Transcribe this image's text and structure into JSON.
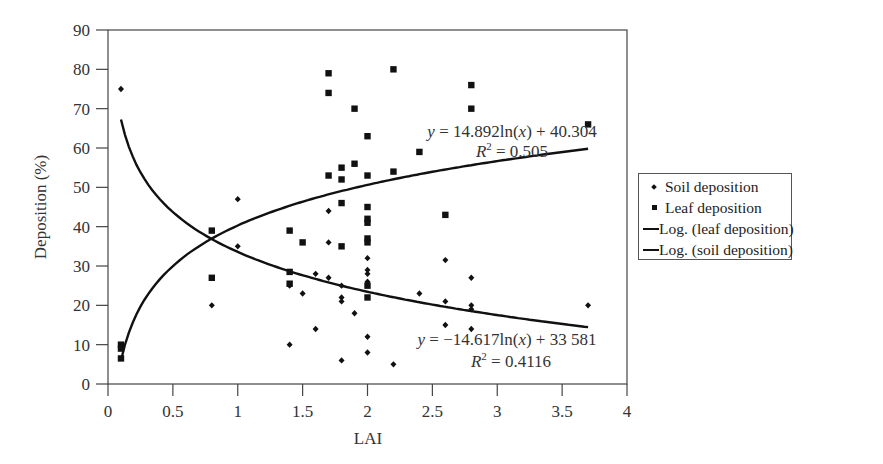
{
  "chart_data": {
    "type": "scatter",
    "title": "",
    "xlabel": "LAI",
    "ylabel": "Deposition (%)",
    "xlim": [
      0,
      4
    ],
    "ylim": [
      0,
      90
    ],
    "x_ticks": [
      "0",
      "0.5",
      "1",
      "1.5",
      "2",
      "2.5",
      "3",
      "3.5",
      "4"
    ],
    "y_ticks": [
      "0",
      "10",
      "20",
      "30",
      "40",
      "50",
      "60",
      "70",
      "80",
      "90"
    ],
    "grid": false,
    "legend_position": "right",
    "series": [
      {
        "name": "Soil deposition",
        "marker": "diamond",
        "points": [
          [
            0.1,
            75
          ],
          [
            0.8,
            20
          ],
          [
            1.0,
            47
          ],
          [
            1.0,
            35
          ],
          [
            1.4,
            25
          ],
          [
            1.4,
            10
          ],
          [
            1.5,
            23
          ],
          [
            1.6,
            28
          ],
          [
            1.6,
            14
          ],
          [
            1.7,
            44
          ],
          [
            1.7,
            36
          ],
          [
            1.7,
            27
          ],
          [
            1.8,
            25
          ],
          [
            1.8,
            22
          ],
          [
            1.8,
            21
          ],
          [
            1.8,
            6
          ],
          [
            1.9,
            18
          ],
          [
            2.0,
            32
          ],
          [
            2.0,
            29
          ],
          [
            2.0,
            28
          ],
          [
            2.0,
            26
          ],
          [
            2.0,
            12
          ],
          [
            2.0,
            8
          ],
          [
            2.2,
            5
          ],
          [
            2.4,
            23
          ],
          [
            2.6,
            31.5
          ],
          [
            2.6,
            21
          ],
          [
            2.6,
            15
          ],
          [
            2.8,
            27
          ],
          [
            2.8,
            20
          ],
          [
            2.8,
            19
          ],
          [
            2.8,
            14
          ],
          [
            3.7,
            20
          ]
        ]
      },
      {
        "name": "Leaf deposition",
        "marker": "square",
        "points": [
          [
            0.1,
            10
          ],
          [
            0.1,
            9
          ],
          [
            0.1,
            6.5
          ],
          [
            0.8,
            39
          ],
          [
            0.8,
            27
          ],
          [
            1.4,
            39
          ],
          [
            1.4,
            28.5
          ],
          [
            1.4,
            25.5
          ],
          [
            1.5,
            36
          ],
          [
            1.7,
            79
          ],
          [
            1.7,
            74
          ],
          [
            1.7,
            53
          ],
          [
            1.8,
            55
          ],
          [
            1.8,
            52
          ],
          [
            1.8,
            46
          ],
          [
            1.8,
            35
          ],
          [
            1.9,
            70
          ],
          [
            1.9,
            56
          ],
          [
            2.0,
            63
          ],
          [
            2.0,
            53
          ],
          [
            2.0,
            45
          ],
          [
            2.0,
            42
          ],
          [
            2.0,
            41
          ],
          [
            2.0,
            37
          ],
          [
            2.0,
            36
          ],
          [
            2.0,
            25
          ],
          [
            2.0,
            22
          ],
          [
            2.2,
            80
          ],
          [
            2.2,
            54
          ],
          [
            2.4,
            59
          ],
          [
            2.6,
            43
          ],
          [
            2.8,
            76
          ],
          [
            2.8,
            70
          ],
          [
            3.7,
            66
          ]
        ]
      },
      {
        "name": "Log. (leaf deposition)",
        "type": "line",
        "equation": "y = 14.892ln(x) + 40.304",
        "a": 14.892,
        "b": 40.304,
        "x_range": [
          0.1,
          3.7
        ],
        "r2": "R2 = 0.505"
      },
      {
        "name": "Log. (soil deposition)",
        "type": "line",
        "equation": "y = −14.617ln(x) + 33 581",
        "a": -14.617,
        "b": 33.581,
        "x_range": [
          0.1,
          3.7
        ],
        "r2": "R2 = 0.4116"
      }
    ],
    "annotations": [
      {
        "text": "y = 14.892ln(x) + 40.304",
        "x": 2.95,
        "y": 63
      },
      {
        "text": "R2 = 0.505",
        "x": 2.95,
        "y": 57
      },
      {
        "text": "y = −14.617ln(x) + 33 581",
        "x": 2.95,
        "y": 10
      },
      {
        "text": "R2 = 0.4116",
        "x": 2.95,
        "y": 4
      }
    ]
  },
  "legend": {
    "items": [
      {
        "label": "Soil deposition",
        "symbol": "diamond"
      },
      {
        "label": "Leaf deposition",
        "symbol": "square"
      },
      {
        "label": "Log. (leaf deposition)",
        "symbol": "line"
      },
      {
        "label": "Log. (soil deposition)",
        "symbol": "line"
      }
    ]
  },
  "equations": {
    "leaf_eq_prefix": "y",
    "leaf_eq_body": " = 14.892ln(",
    "leaf_eq_x": "x",
    "leaf_eq_tail": ") + 40.304",
    "leaf_r2_R": "R",
    "leaf_r2_exp": "2",
    "leaf_r2_val": " = 0.505",
    "soil_eq_prefix": "y",
    "soil_eq_body": " = −14.617ln(",
    "soil_eq_x": "x",
    "soil_eq_tail": ") + 33 581",
    "soil_r2_R": "R",
    "soil_r2_exp": "2",
    "soil_r2_val": " = 0.4116"
  },
  "colors": {
    "ink": "#111111",
    "text": "#333333",
    "background": "#ffffff"
  }
}
